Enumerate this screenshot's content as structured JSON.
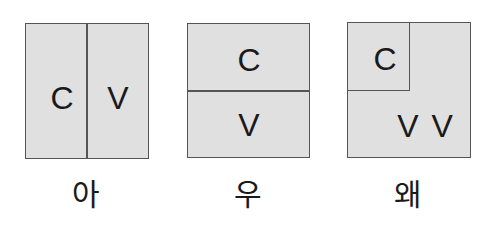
{
  "diagram": {
    "panels": [
      {
        "caption": "아",
        "layout": "side-by-side",
        "cells": [
          {
            "label": "C",
            "position": "left"
          },
          {
            "label": "V",
            "position": "right"
          }
        ]
      },
      {
        "caption": "우",
        "layout": "stacked",
        "cells": [
          {
            "label": "C",
            "position": "top"
          },
          {
            "label": "V",
            "position": "bottom"
          }
        ]
      },
      {
        "caption": "왜",
        "layout": "corner",
        "cells": [
          {
            "label": "C",
            "position": "top-left"
          },
          {
            "label": "V V",
            "position": "bottom-right"
          }
        ]
      }
    ],
    "colors": {
      "box_fill": "#e0e0e0",
      "border": "#555555",
      "text": "#1a1a1a"
    }
  }
}
